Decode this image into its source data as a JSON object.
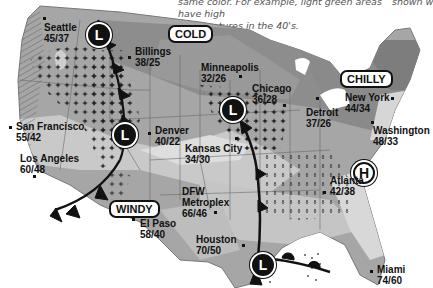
{
  "caption": {
    "line1": "same color. For example, light green areas have high",
    "line2": "temperatures in the 40's.",
    "right_fragment": "shown w"
  },
  "colors": {
    "land_dark": "#8a8a8a",
    "land_mid": "#a6a6a6",
    "land_light": "#c9c9c9",
    "land_lightest": "#e2e2e2",
    "front": "#111111",
    "water": "#ffffff"
  },
  "labels": {
    "cold": "COLD",
    "chilly": "CHILLY",
    "windy": "WINDY"
  },
  "pressure_systems": [
    {
      "type": "low",
      "symbol": "L",
      "location": "northwest"
    },
    {
      "type": "low",
      "symbol": "L",
      "location": "west-central"
    },
    {
      "type": "low",
      "symbol": "L",
      "location": "central"
    },
    {
      "type": "low",
      "symbol": "L",
      "location": "gulf"
    },
    {
      "type": "high",
      "symbol": "H",
      "location": "mid-atlantic"
    }
  ],
  "cities": [
    {
      "name": "Seattle",
      "temp": "45/37"
    },
    {
      "name": "Billings",
      "temp": "38/25"
    },
    {
      "name": "Minneapolis",
      "temp": "32/26"
    },
    {
      "name": "Chicago",
      "temp": "36/28"
    },
    {
      "name": "Detroit",
      "temp": "37/26"
    },
    {
      "name": "New York",
      "temp": "44/34"
    },
    {
      "name": "Washington",
      "temp": "48/33"
    },
    {
      "name": "San Francisco",
      "temp": "55/42"
    },
    {
      "name": "Denver",
      "temp": "40/22"
    },
    {
      "name": "Kansas City",
      "temp": "34/30"
    },
    {
      "name": "Los Angeles",
      "temp": "60/48"
    },
    {
      "name": "Atlanta",
      "temp": "42/38"
    },
    {
      "name": "DFW Metroplex",
      "name_line1": "DFW",
      "name_line2": "Metroplex",
      "temp": "66/46"
    },
    {
      "name": "El Paso",
      "temp": "58/40"
    },
    {
      "name": "Houston",
      "temp": "70/50"
    },
    {
      "name": "Miami",
      "temp": "74/60"
    }
  ]
}
